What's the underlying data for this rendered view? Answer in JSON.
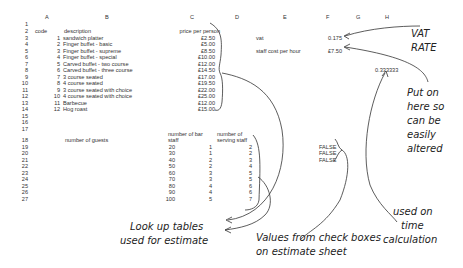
{
  "columns": [
    "A",
    "B",
    "C",
    "D",
    "E",
    "F",
    "G",
    "H"
  ],
  "row_numbers": [
    "1",
    "2",
    "3",
    "4",
    "5",
    "6",
    "7",
    "8",
    "9",
    "10",
    "11",
    "12",
    "13",
    "14",
    "15",
    "16",
    "17",
    "18",
    "19",
    "20",
    "21",
    "22",
    "23",
    "24",
    "25",
    "26",
    "27"
  ],
  "menu_table": {
    "headers": {
      "code": "code",
      "description": "description",
      "price": "price per person"
    },
    "rows": [
      {
        "code": "1",
        "description": "sandwich platter",
        "price": "£2.50"
      },
      {
        "code": "2",
        "description": "Finger buffet - basic",
        "price": "£5.00"
      },
      {
        "code": "3",
        "description": "Finger buffet - supreme",
        "price": "£8.50"
      },
      {
        "code": "4",
        "description": "Finger buffet - special",
        "price": "£10.00"
      },
      {
        "code": "5",
        "description": "Carved buffet - two course",
        "price": "£12.00"
      },
      {
        "code": "6",
        "description": "Carved buffet - three course",
        "price": "£14.50"
      },
      {
        "code": "7",
        "description": "3 course seated",
        "price": "£17.00"
      },
      {
        "code": "8",
        "description": "4 course seated",
        "price": "£19.50"
      },
      {
        "code": "9",
        "description": "3 course seated with choice",
        "price": "£22.00"
      },
      {
        "code": "10",
        "description": "4 course seated with choice",
        "price": "£25.00"
      },
      {
        "code": "11",
        "description": "Barbecue",
        "price": "£12.00"
      },
      {
        "code": "12",
        "description": "Hog roast",
        "price": "£15.00"
      }
    ]
  },
  "settings": {
    "vat_label": "vat",
    "vat_value": "0.175",
    "staff_cost_label": "staff cost per hour",
    "staff_cost_value": "£7.50",
    "time_factor": "0.333333"
  },
  "staff_table": {
    "headers": {
      "guests": "number of guests",
      "bar_line1": "number of bar",
      "bar_line2": "staff",
      "serving_line1": "number of",
      "serving_line2": "serving staff"
    },
    "rows": [
      {
        "guests": "20",
        "bar": "1",
        "serving": "2"
      },
      {
        "guests": "30",
        "bar": "1",
        "serving": "2"
      },
      {
        "guests": "40",
        "bar": "2",
        "serving": "3"
      },
      {
        "guests": "50",
        "bar": "2",
        "serving": "4"
      },
      {
        "guests": "60",
        "bar": "3",
        "serving": "5"
      },
      {
        "guests": "70",
        "bar": "3",
        "serving": "5"
      },
      {
        "guests": "80",
        "bar": "4",
        "serving": "6"
      },
      {
        "guests": "90",
        "bar": "4",
        "serving": "6"
      },
      {
        "guests": "100",
        "bar": "5",
        "serving": "7"
      }
    ]
  },
  "checkbox_values": [
    "FALSE",
    "FALSE",
    "FALSE"
  ],
  "annotations": {
    "vat_rate": [
      "VAT",
      "RATE"
    ],
    "put_on_here": [
      "Put on",
      "here so",
      "can be",
      "easily",
      "altered"
    ],
    "lookup_tables": [
      "Look up tables",
      "used for estimate"
    ],
    "check_boxes": [
      "Values from check boxes",
      "on estimate sheet"
    ],
    "time_calc": [
      "used on",
      "time",
      "calculation"
    ]
  }
}
